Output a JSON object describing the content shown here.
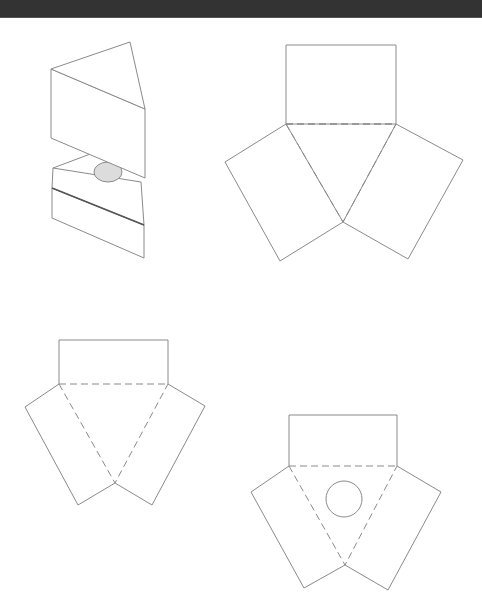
{
  "header": {
    "bar_color": "#333333"
  },
  "colors": {
    "background": "#ffffff",
    "line": "#8a8a8a",
    "thick_line": "#555555",
    "hole_fill": "#dcdcdc"
  },
  "figures": [
    {
      "id": "assembled-prism",
      "description": "3D view of triangular prism lifted above a triangular base with a circular hole",
      "top_prism": {
        "top_face": [
          [
            51,
            69
          ],
          [
            130,
            42
          ],
          [
            145,
            109
          ]
        ],
        "front_face": [
          [
            51,
            69
          ],
          [
            145,
            109
          ],
          [
            145,
            178
          ],
          [
            51,
            138
          ]
        ],
        "back_edge": [
          [
            130,
            42
          ],
          [
            145,
            109
          ]
        ]
      },
      "base": {
        "top_face_edges": [
          [
            [
              53,
              168
            ],
            [
              93,
              153
            ]
          ],
          [
            [
              53,
              168
            ],
            [
              141,
              182
            ]
          ]
        ],
        "band_top": [
          [
            53,
            168
          ],
          [
            141,
            182
          ],
          [
            144,
            225
          ],
          [
            52,
            188
          ]
        ],
        "band_divider": [
          [
            52,
            188
          ],
          [
            144,
            225
          ]
        ],
        "lower_face": [
          [
            52,
            188
          ],
          [
            144,
            225
          ],
          [
            144,
            258
          ],
          [
            52,
            218
          ]
        ]
      },
      "hole": {
        "cx": 108,
        "cy": 172,
        "rx": 14,
        "ry": 10
      }
    },
    {
      "id": "net-tall",
      "rect": [
        [
          286,
          45
        ],
        [
          396,
          45
        ],
        [
          396,
          124
        ],
        [
          286,
          124
        ]
      ],
      "triangle": [
        [
          286,
          124
        ],
        [
          396,
          124
        ],
        [
          343,
          222
        ]
      ],
      "left_flap": [
        [
          286,
          124
        ],
        [
          225,
          162
        ],
        [
          280,
          261
        ],
        [
          343,
          222
        ]
      ],
      "right_flap": [
        [
          396,
          124
        ],
        [
          463,
          160
        ],
        [
          408,
          259
        ],
        [
          343,
          222
        ]
      ]
    },
    {
      "id": "net-short",
      "rect": [
        [
          59,
          340
        ],
        [
          168,
          340
        ],
        [
          168,
          384
        ],
        [
          59,
          384
        ]
      ],
      "triangle": [
        [
          59,
          384
        ],
        [
          168,
          384
        ],
        [
          115,
          483
        ]
      ],
      "left_flap": [
        [
          59,
          384
        ],
        [
          25,
          407
        ],
        [
          78,
          505
        ],
        [
          115,
          483
        ]
      ],
      "right_flap": [
        [
          168,
          384
        ],
        [
          205,
          406
        ],
        [
          152,
          505
        ],
        [
          115,
          483
        ]
      ]
    },
    {
      "id": "net-with-hole",
      "rect": [
        [
          289,
          415
        ],
        [
          397,
          415
        ],
        [
          397,
          466
        ],
        [
          289,
          466
        ]
      ],
      "triangle": [
        [
          289,
          466
        ],
        [
          397,
          466
        ],
        [
          345,
          565
        ]
      ],
      "left_flap": [
        [
          289,
          466
        ],
        [
          251,
          492
        ],
        [
          304,
          588
        ],
        [
          345,
          565
        ]
      ],
      "right_flap": [
        [
          397,
          466
        ],
        [
          441,
          492
        ],
        [
          388,
          590
        ],
        [
          345,
          565
        ]
      ],
      "hole": {
        "cx": 344,
        "cy": 499,
        "r": 18
      }
    }
  ]
}
